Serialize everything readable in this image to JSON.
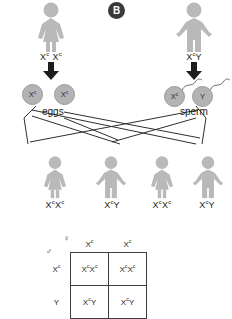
{
  "panel": {
    "label": "B"
  },
  "parents": {
    "mother": {
      "sex": "female",
      "genotype_plain": "XcXc",
      "allele1": "X",
      "allele1_sup": "c",
      "allele2": "X",
      "allele2_sup": "c"
    },
    "father": {
      "sex": "male",
      "genotype_plain": "XcY",
      "allele1": "X",
      "allele1_sup": "c",
      "allele2": "Y",
      "allele2_sup": ""
    }
  },
  "gametes": {
    "eggs_label": "eggs",
    "sperm_label": "sperm",
    "eggs": [
      {
        "allele": "X",
        "sup": "c"
      },
      {
        "allele": "X",
        "sup": "c"
      }
    ],
    "sperm": [
      {
        "allele": "X",
        "sup": "c"
      },
      {
        "allele": "Y",
        "sup": ""
      }
    ]
  },
  "offspring": [
    {
      "sex": "female",
      "a1": "X",
      "s1": "c",
      "a2": "X",
      "s2": "c"
    },
    {
      "sex": "male",
      "a1": "X",
      "s1": "c",
      "a2": "Y",
      "s2": ""
    },
    {
      "sex": "female",
      "a1": "X",
      "s1": "c",
      "a2": "X",
      "s2": "c"
    },
    {
      "sex": "male",
      "a1": "X",
      "s1": "c",
      "a2": "Y",
      "s2": ""
    }
  ],
  "punnett": {
    "female_symbol": "♀",
    "male_symbol": "♂",
    "col_headers": [
      {
        "allele": "X",
        "sup": "c"
      },
      {
        "allele": "X",
        "sup": "c"
      }
    ],
    "row_headers": [
      {
        "allele": "X",
        "sup": "c"
      },
      {
        "allele": "Y",
        "sup": ""
      }
    ],
    "cells": [
      [
        {
          "a1": "X",
          "s1": "c",
          "a2": "X",
          "s2": "c"
        },
        {
          "a1": "X",
          "s1": "c",
          "a2": "X",
          "s2": "c"
        }
      ],
      [
        {
          "a1": "X",
          "s1": "c",
          "a2": "Y",
          "s2": ""
        },
        {
          "a1": "X",
          "s1": "c",
          "a2": "Y",
          "s2": ""
        }
      ]
    ]
  },
  "colors": {
    "figure_fill": "#b9b9b9",
    "figure_stroke": "#a6a6a6",
    "gamete_fill": "#b3b3b3",
    "badge_bg": "#3a3a3a",
    "line": "#2e2e2e",
    "text": "#1a1a1a"
  }
}
